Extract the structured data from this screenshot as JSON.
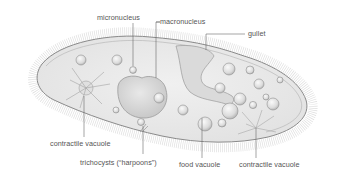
{
  "diagram": {
    "colors": {
      "background": "#ffffff",
      "body_fill": "#ececec",
      "outline": "#8a8a8a",
      "cilia": "#9a9a9a",
      "label_text": "#555555",
      "leader_line": "#6a6a6a"
    },
    "labels": {
      "micronucleus": "micronucleus",
      "macronucleus": "macronucleus",
      "gullet": "gullet",
      "contractile_vacuole_left": "contractile vacuole",
      "trichocysts": "trichocysts (“harpoons”)",
      "food_vacuole": "food vacuole",
      "contractile_vacuole_right": "contractile vacuole"
    }
  }
}
